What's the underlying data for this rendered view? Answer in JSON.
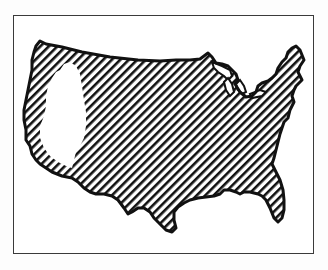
{
  "figure": {
    "style": "black-and-white diagonal hatching",
    "colors": {
      "background": "#ffffff",
      "ink": "#111111",
      "frame": "#3a3a3a"
    },
    "regions": [
      {
        "name": "hatched-area",
        "description": "Most of the contiguous United States, hatched"
      },
      {
        "name": "unhatched-area",
        "description": "Western interior region (California/Nevada) left white"
      }
    ]
  }
}
